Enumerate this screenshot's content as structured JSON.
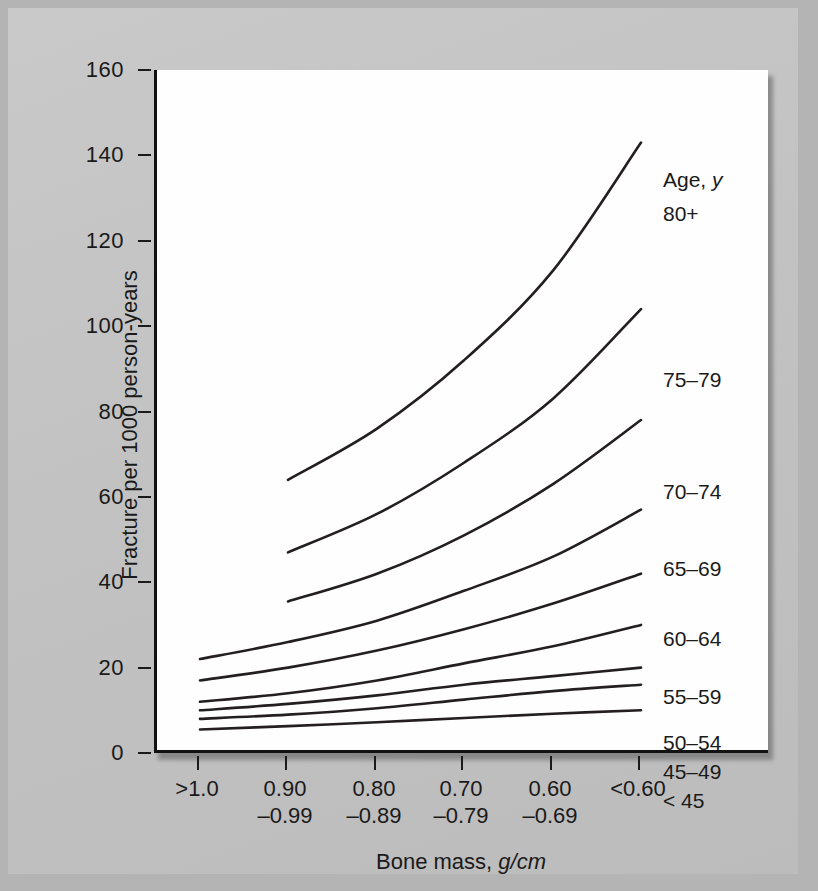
{
  "chart_data": {
    "type": "line",
    "title": "",
    "xlabel": "Bone mass, g/cm",
    "ylabel": "Fracture per 1000 person-years",
    "legend_title": "Age, y",
    "legend_position": "inline-right",
    "grid": false,
    "ylim": [
      0,
      160
    ],
    "yticks": [
      0,
      20,
      40,
      60,
      80,
      100,
      120,
      140,
      160
    ],
    "categories": [
      ">1.0",
      "0.90–0.99",
      "0.80–0.89",
      "0.70–0.79",
      "0.60–0.69",
      "<0.60"
    ],
    "xtick_labels": [
      {
        "line1": ">1.0",
        "line2": ""
      },
      {
        "line1": "0.90",
        "line2": "–0.99"
      },
      {
        "line1": "0.80",
        "line2": "–0.89"
      },
      {
        "line1": "0.70",
        "line2": "–0.79"
      },
      {
        "line1": "0.60",
        "line2": "–0.69"
      },
      {
        "line1": "<0.60",
        "line2": ""
      }
    ],
    "series": [
      {
        "name": "80+",
        "x": [
          1,
          2,
          3,
          4,
          5
        ],
        "values": [
          64,
          76,
          92,
          113,
          143
        ]
      },
      {
        "name": "75–79",
        "x": [
          1,
          2,
          3,
          4,
          5
        ],
        "values": [
          47,
          56,
          68,
          83,
          104
        ]
      },
      {
        "name": "70–74",
        "x": [
          1,
          2,
          3,
          4,
          5
        ],
        "values": [
          35.5,
          42,
          51,
          63,
          78
        ]
      },
      {
        "name": "65–69",
        "x": [
          0,
          1,
          2,
          3,
          4,
          5
        ],
        "values": [
          22,
          26,
          31,
          38,
          46,
          57
        ]
      },
      {
        "name": "60–64",
        "x": [
          0,
          1,
          2,
          3,
          4,
          5
        ],
        "values": [
          17,
          20,
          24,
          29,
          35,
          42
        ]
      },
      {
        "name": "55–59",
        "x": [
          0,
          1,
          2,
          3,
          4,
          5
        ],
        "values": [
          12,
          14,
          17,
          21,
          25,
          30
        ]
      },
      {
        "name": "50–54",
        "x": [
          0,
          1,
          2,
          3,
          4,
          5
        ],
        "values": [
          10,
          11.5,
          13.5,
          16,
          18,
          20
        ]
      },
      {
        "name": "45–49",
        "x": [
          0,
          1,
          2,
          3,
          4,
          5
        ],
        "values": [
          8,
          9,
          10.5,
          12.5,
          14.5,
          16
        ]
      },
      {
        "name": "< 45",
        "x": [
          0,
          1,
          2,
          3,
          4,
          5
        ],
        "values": [
          5.5,
          6.3,
          7.2,
          8.2,
          9.2,
          10
        ]
      }
    ],
    "series_label_positions": [
      {
        "name": "80+",
        "left": 506,
        "top": 132
      },
      {
        "name": "75–79",
        "left": 506,
        "top": 298
      },
      {
        "name": "70–74",
        "left": 506,
        "top": 410
      },
      {
        "name": "65–69",
        "left": 506,
        "top": 487
      },
      {
        "name": "60–64",
        "left": 506,
        "top": 557
      },
      {
        "name": "55–59",
        "left": 506,
        "top": 615
      },
      {
        "name": "50–54",
        "left": 506,
        "top": 661
      },
      {
        "name": "45–49",
        "left": 506,
        "top": 690
      },
      {
        "name": "< 45",
        "left": 506,
        "top": 719
      }
    ],
    "legend_title_position": {
      "left": 506,
      "top": 98
    },
    "line_color": "#231f20",
    "line_width": 2.6,
    "plot_background": "#fefefe",
    "page_background": "#c3c3c3"
  }
}
